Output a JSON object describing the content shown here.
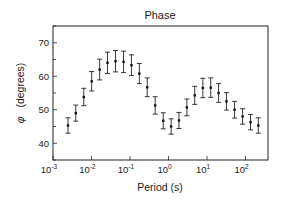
{
  "chart_data": {
    "type": "scatter",
    "title": "Phase",
    "xlabel": "Period (s)",
    "ylabel": "φ  (degrees)",
    "xscale": "log",
    "xlim": [
      0.001,
      400
    ],
    "ylim": [
      35,
      75
    ],
    "xticks": [
      {
        "base": "10",
        "exp": "-3",
        "value": 0.001
      },
      {
        "base": "10",
        "exp": "-2",
        "value": 0.01
      },
      {
        "base": "10",
        "exp": "-1",
        "value": 0.1
      },
      {
        "base": "10",
        "exp": "0",
        "value": 1
      },
      {
        "base": "10",
        "exp": "1",
        "value": 10
      },
      {
        "base": "10",
        "exp": "2",
        "value": 100
      }
    ],
    "yticks": [
      40,
      50,
      60,
      70
    ],
    "grid": false,
    "legend": null,
    "series": [
      {
        "name": "Phase",
        "marker": "square",
        "error_bars": true,
        "x": [
          0.00245,
          0.0039,
          0.0063,
          0.0101,
          0.0163,
          0.026,
          0.042,
          0.068,
          0.109,
          0.175,
          0.28,
          0.45,
          0.73,
          1.17,
          1.87,
          3.0,
          4.8,
          7.8,
          12.5,
          20,
          32,
          52,
          84,
          135,
          215
        ],
        "y": [
          45.3,
          49.0,
          53.8,
          58.5,
          62.0,
          64.0,
          64.5,
          64.3,
          63.3,
          60.8,
          56.7,
          51.3,
          46.7,
          45.0,
          46.8,
          50.7,
          54.3,
          56.5,
          56.6,
          55.0,
          52.5,
          50.0,
          48.0,
          46.3,
          45.3
        ],
        "err": [
          2.3,
          2.4,
          2.6,
          2.9,
          3.1,
          3.2,
          3.2,
          3.2,
          3.1,
          3.0,
          2.8,
          2.6,
          2.4,
          2.3,
          2.4,
          2.5,
          2.7,
          2.9,
          2.9,
          2.8,
          2.6,
          2.5,
          2.3,
          2.3,
          2.3
        ]
      }
    ]
  },
  "text": {
    "title": "Phase",
    "xlabel": "Period (s)",
    "ylabel_symbol": "φ",
    "ylabel_text": "(degrees)"
  }
}
